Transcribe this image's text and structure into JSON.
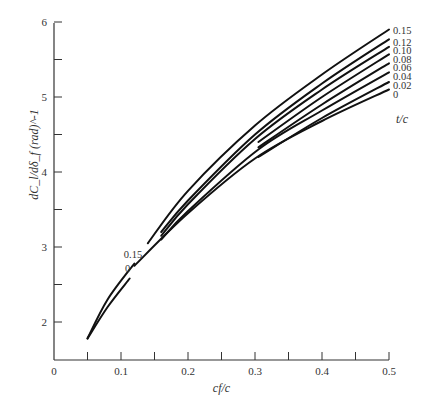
{
  "chart_data": {
    "type": "line",
    "title": "",
    "xlabel": "c_f/c",
    "ylabel": "dC_l/dδ_f (rad)^-1",
    "xlim": [
      0,
      0.5
    ],
    "ylim": [
      1.5,
      6
    ],
    "grid": false,
    "x_ticks": [
      0,
      0.1,
      0.2,
      0.3,
      0.4,
      0.5
    ],
    "x_tick_labels": [
      "0",
      "0.1",
      "0.2",
      "0.3",
      "0.4",
      "0.5"
    ],
    "x_minor_ticks": [
      0.05,
      0.15,
      0.25,
      0.35,
      0.45
    ],
    "y_ticks": [
      2,
      3,
      4,
      5,
      6
    ],
    "y_tick_labels": [
      "2",
      "3",
      "4",
      "5",
      "6"
    ],
    "y_minor_ticks": [
      2.5,
      3.5,
      4.5,
      5.5
    ],
    "legend_title": "t/c",
    "legend_position": "right",
    "annotations": [
      {
        "text": "0.15",
        "x": 0.118,
        "y": 2.85
      },
      {
        "text": "0",
        "x": 0.11,
        "y": 2.67
      }
    ],
    "series": [
      {
        "name": "0.15",
        "segments": [
          [
            [
              0.05,
              1.78
            ],
            [
              0.08,
              2.3
            ],
            [
              0.12,
              2.78
            ]
          ],
          [
            [
              0.14,
              3.05
            ],
            [
              0.2,
              3.75
            ],
            [
              0.3,
              4.62
            ],
            [
              0.4,
              5.3
            ],
            [
              0.5,
              5.9
            ]
          ]
        ]
      },
      {
        "name": "0.12",
        "segments": [
          [
            [
              0.16,
              3.2
            ],
            [
              0.2,
              3.62
            ],
            [
              0.3,
              4.5
            ],
            [
              0.4,
              5.18
            ],
            [
              0.5,
              5.77
            ]
          ]
        ]
      },
      {
        "name": "0.10",
        "segments": [
          [
            [
              0.16,
              3.15
            ],
            [
              0.2,
              3.57
            ],
            [
              0.3,
              4.44
            ],
            [
              0.4,
              5.1
            ],
            [
              0.5,
              5.67
            ]
          ]
        ]
      },
      {
        "name": "0.08",
        "segments": [
          [
            [
              0.305,
              4.4
            ],
            [
              0.4,
              5.0
            ],
            [
              0.5,
              5.57
            ]
          ]
        ]
      },
      {
        "name": "0.06",
        "segments": [
          [
            [
              0.305,
              4.33
            ],
            [
              0.4,
              4.9
            ],
            [
              0.5,
              5.45
            ]
          ]
        ]
      },
      {
        "name": "0.04",
        "segments": [
          [
            [
              0.16,
              3.1
            ],
            [
              0.2,
              3.48
            ],
            [
              0.305,
              4.3
            ],
            [
              0.4,
              4.82
            ],
            [
              0.5,
              5.33
            ]
          ]
        ]
      },
      {
        "name": "0.02",
        "segments": [
          [
            [
              0.305,
              4.2
            ],
            [
              0.4,
              4.72
            ],
            [
              0.5,
              5.2
            ]
          ]
        ]
      },
      {
        "name": "0",
        "segments": [
          [
            [
              0.05,
              1.78
            ],
            [
              0.08,
              2.2
            ],
            [
              0.113,
              2.58
            ]
          ],
          [
            [
              0.12,
              2.75
            ],
            [
              0.2,
              3.45
            ],
            [
              0.3,
              4.18
            ],
            [
              0.4,
              4.68
            ],
            [
              0.5,
              5.1
            ]
          ]
        ]
      }
    ]
  },
  "legend": {
    "title": "t/c",
    "labels": [
      "0.15",
      "0.12",
      "0.10",
      "0.08",
      "0.06",
      "0.04",
      "0.02",
      "0"
    ]
  },
  "axes": {
    "xlabel": "c_f/c",
    "ylabel": "dC_l/dδ_f (rad)^-1"
  }
}
